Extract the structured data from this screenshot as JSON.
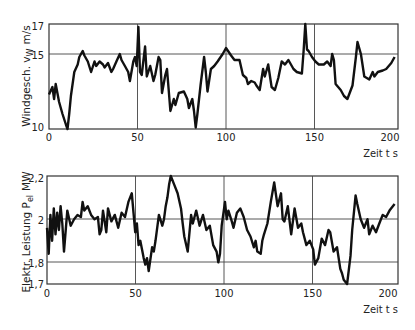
{
  "chart_data": [
    {
      "type": "line",
      "title": "",
      "xlabel": "Zeit t s",
      "ylabel": "Windgesch. v_W m/s",
      "ylabel_main": "Windgesch. v",
      "ylabel_sub": "W",
      "ylabel_unit": "m/s",
      "xlim": [
        0,
        207
      ],
      "ylim": [
        10,
        17
      ],
      "xticks": [
        0,
        50,
        100,
        150,
        200
      ],
      "yticks": [
        10,
        15,
        17
      ],
      "ytick_labels": [
        "10",
        "15",
        "17"
      ],
      "gridlines_x": [
        50,
        100,
        150
      ],
      "gridlines_y": [
        15
      ],
      "series": [
        {
          "name": "Windgeschwindigkeit",
          "x": [
            0,
            2,
            3,
            4,
            5,
            6,
            8,
            10,
            11,
            12,
            13,
            15,
            17,
            18,
            20,
            21,
            23,
            25,
            27,
            28,
            30,
            32,
            33,
            35,
            37,
            38,
            40,
            42,
            43,
            45,
            47,
            48,
            50,
            51,
            52,
            53,
            54,
            55,
            57,
            58,
            60,
            62,
            63,
            65,
            66,
            67,
            69,
            70,
            72,
            74,
            75,
            77,
            80,
            82,
            83,
            85,
            86,
            87,
            88,
            90,
            92,
            93,
            94,
            96,
            98,
            100,
            103,
            105,
            108,
            110,
            113,
            115,
            117,
            118,
            120,
            122,
            123,
            125,
            127,
            128,
            130,
            132,
            134,
            136,
            138,
            140,
            142,
            143,
            145,
            147,
            150,
            151,
            152,
            153,
            154,
            156,
            158,
            160,
            163,
            165,
            167,
            168,
            169,
            170,
            173,
            175,
            177,
            178,
            180,
            182,
            183,
            185,
            187,
            190,
            192,
            193,
            195,
            198,
            200,
            203,
            205
          ],
          "y": [
            12.3,
            12.8,
            12,
            13,
            12.4,
            11.8,
            11,
            10.3,
            10,
            11,
            12.2,
            13.8,
            14.3,
            14.8,
            15.2,
            14.9,
            14.5,
            13.8,
            14.5,
            14.2,
            14.5,
            14.3,
            14.1,
            14.4,
            13.8,
            14,
            14.5,
            15,
            14.6,
            14.2,
            13.8,
            13.2,
            14.5,
            14.8,
            14.2,
            16.8,
            13.8,
            13.6,
            15.5,
            13.5,
            14.2,
            13.2,
            13.6,
            14.8,
            14.6,
            12.4,
            13.6,
            14,
            11.2,
            12,
            11.6,
            12.4,
            12.5,
            12,
            11.4,
            12,
            11.2,
            10.1,
            11,
            13,
            14.8,
            13.8,
            12.5,
            14,
            14.2,
            14.5,
            15,
            15.4,
            14.9,
            14.6,
            14.6,
            13.6,
            13.4,
            13,
            13.2,
            13.1,
            12.9,
            12.6,
            14,
            13.5,
            14.3,
            12.8,
            12.6,
            13.4,
            14.5,
            14.3,
            14.6,
            14.4,
            14,
            13.8,
            13.7,
            15.2,
            17,
            15.3,
            15.2,
            14.8,
            14.5,
            14.3,
            14.3,
            14.5,
            14.2,
            15,
            14.6,
            13,
            12.6,
            12.2,
            12,
            12.3,
            12.9,
            14.8,
            15.8,
            15,
            13.5,
            13.3,
            13.8,
            13.5,
            13.8,
            13.9,
            14,
            14.4,
            14.8
          ]
        }
      ]
    },
    {
      "type": "line",
      "title": "",
      "xlabel": "Zeit t s",
      "ylabel": "Elektr. Leistung P_el MW",
      "ylabel_main": "Elektr. Leistung P",
      "ylabel_sub": "el",
      "ylabel_unit": "MW",
      "xlim": [
        0,
        207
      ],
      "ylim": [
        1.7,
        2.2
      ],
      "xticks": [
        0,
        50,
        100,
        150,
        200
      ],
      "yticks": [
        1.7,
        1.8,
        2.0,
        2.2
      ],
      "ytick_labels": [
        "1,7",
        "1,8",
        "2",
        "2,2"
      ],
      "gridlines_x": [
        50,
        100,
        150
      ],
      "gridlines_y": [
        1.8,
        2.0
      ],
      "series": [
        {
          "name": "Elektrische Leistung",
          "x": [
            0,
            1,
            2,
            3,
            4,
            5,
            6,
            7,
            8,
            9,
            10,
            12,
            14,
            16,
            18,
            20,
            21,
            22,
            24,
            26,
            28,
            30,
            31,
            32,
            33,
            35,
            36,
            38,
            40,
            42,
            44,
            46,
            48,
            50,
            51,
            52,
            53,
            54,
            55,
            57,
            58,
            59,
            60,
            62,
            63,
            64,
            66,
            68,
            69,
            70,
            71,
            72,
            73,
            75,
            77,
            79,
            80,
            81,
            83,
            85,
            86,
            88,
            90,
            92,
            94,
            96,
            98,
            100,
            101,
            102,
            103,
            105,
            106,
            107,
            109,
            110,
            112,
            114,
            116,
            118,
            120,
            122,
            123,
            124,
            126,
            127,
            128,
            130,
            132,
            134,
            136,
            138,
            139,
            140,
            142,
            144,
            146,
            148,
            150,
            151,
            153,
            155,
            157,
            158,
            160,
            162,
            164,
            166,
            167,
            169,
            171,
            173,
            174,
            175,
            177,
            179,
            180,
            182,
            183,
            185,
            187,
            189,
            190,
            192,
            194,
            196,
            198,
            200,
            202,
            205
          ],
          "y": [
            1.96,
            1.84,
            2.02,
            1.9,
            2.05,
            1.93,
            2.03,
            1.95,
            2.06,
            1.98,
            1.85,
            2.04,
            1.97,
            2.0,
            2.02,
            2.01,
            2.08,
            2.04,
            2.06,
            2.02,
            2.0,
            2.01,
            1.93,
            1.95,
            2.04,
            1.94,
            2.05,
            1.99,
            2.02,
            1.96,
            2.03,
            2.01,
            2.08,
            2.12,
            2.03,
            1.94,
            1.98,
            1.88,
            1.9,
            1.82,
            1.79,
            1.82,
            1.76,
            1.87,
            1.85,
            1.9,
            2.02,
            1.97,
            2.0,
            2.06,
            2.1,
            2.16,
            2.2,
            2.16,
            2.12,
            2.05,
            1.98,
            1.92,
            1.85,
            2.02,
            1.98,
            2.04,
            1.97,
            2.02,
            1.95,
            1.97,
            1.88,
            1.85,
            1.8,
            1.84,
            1.97,
            2.08,
            2.0,
            2.04,
            1.99,
            1.96,
            2.03,
            2.05,
            2.01,
            1.95,
            1.92,
            1.87,
            1.9,
            1.85,
            1.84,
            1.9,
            1.93,
            1.98,
            2.08,
            2.17,
            2.06,
            2.12,
            2.0,
            1.99,
            2.06,
            1.93,
            2.05,
            1.96,
            1.98,
            1.94,
            1.88,
            1.9,
            1.86,
            1.79,
            1.82,
            1.91,
            1.88,
            1.95,
            1.94,
            1.85,
            1.87,
            1.77,
            1.75,
            1.72,
            1.7,
            1.83,
            1.95,
            2.11,
            2.07,
            2.0,
            1.96,
            2.0,
            1.93,
            1.97,
            1.94,
            1.98,
            2.02,
            2.01,
            2.04,
            2.07
          ]
        }
      ]
    }
  ],
  "charts": {
    "top": {
      "ylabel_main": "Windgesch. v",
      "ylabel_sub": "W",
      "ylabel_unit": "m/s",
      "xlabel": "Zeit t s",
      "xtick_labels": [
        "0",
        "50",
        "100",
        "150",
        "200"
      ],
      "ytick_labels": [
        "10",
        "15",
        "17"
      ]
    },
    "bottom": {
      "ylabel_main": "Elektr. Leistung P",
      "ylabel_sub": "el",
      "ylabel_unit": "MW",
      "xlabel": "Zeit t s",
      "xtick_labels": [
        "0",
        "50",
        "100",
        "150",
        "200"
      ],
      "ytick_labels": [
        "1,7",
        "1,8",
        "2",
        "2,2"
      ]
    }
  },
  "colors": {
    "line": "#111111",
    "frame": "#333333",
    "grid": "#444444"
  }
}
